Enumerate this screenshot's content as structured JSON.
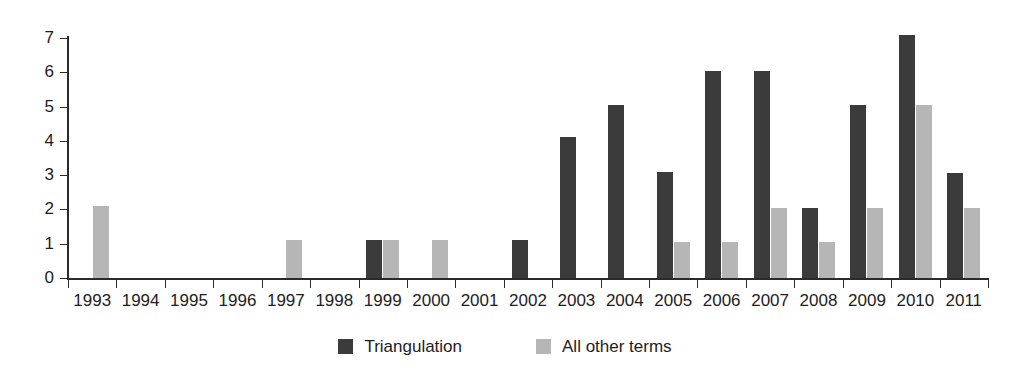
{
  "chart_data": {
    "type": "bar",
    "title": "",
    "subtitle": "",
    "xlabel": "",
    "ylabel": "",
    "ylim": [
      0,
      7
    ],
    "yticks": [
      "0",
      "1",
      "2",
      "3",
      "4",
      "5",
      "6",
      "7"
    ],
    "grid": false,
    "legend_position": "bottom-center",
    "categories": [
      "1993",
      "1994",
      "1995",
      "1996",
      "1997",
      "1998",
      "1999",
      "2000",
      "2001",
      "2002",
      "2003",
      "2004",
      "2005",
      "2006",
      "2007",
      "2008",
      "2009",
      "2010",
      "2011"
    ],
    "series": [
      {
        "name": "Triangulation",
        "color": "#3b3b3b",
        "values": [
          0,
          0,
          0,
          0,
          0,
          0,
          1.1,
          0,
          0,
          1.1,
          4.1,
          5.05,
          3.1,
          6.05,
          6.05,
          2.05,
          5.05,
          7.1,
          3.05
        ]
      },
      {
        "name": "All other terms",
        "color": "#b6b6b6",
        "values": [
          2.1,
          0,
          0,
          0,
          1.1,
          0,
          1.1,
          1.1,
          0,
          0,
          0,
          0,
          1.05,
          1.05,
          2.05,
          1.05,
          2.05,
          5.05,
          2.05
        ]
      }
    ]
  },
  "legend": {
    "items": [
      {
        "label": "Triangulation",
        "swatch": "dark"
      },
      {
        "label": "All other terms",
        "swatch": "light"
      }
    ]
  }
}
